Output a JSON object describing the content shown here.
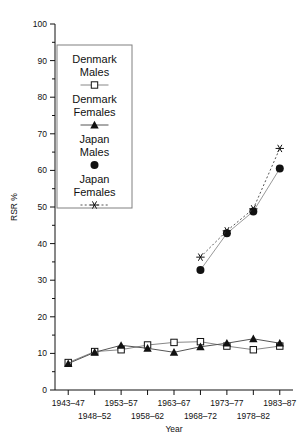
{
  "chart_data": {
    "type": "line",
    "title": "",
    "xlabel": "Year",
    "ylabel": "RSR %",
    "ylim": [
      0,
      100
    ],
    "ytick_step": 10,
    "yminor_step": 5,
    "grid": false,
    "legend_position": "upper-left-inset",
    "categories": [
      "1943-47",
      "1948-52",
      "1953-57",
      "1958-62",
      "1963-67",
      "1968-72",
      "1973-77",
      "1978-82",
      "1983-87"
    ],
    "xticklabels_row1": [
      "1943-47",
      "1953-57",
      "1963-67",
      "1973-77",
      "1983-87"
    ],
    "xticklabels_row2": [
      "1948-52",
      "1958-62",
      "1968-72",
      "1978-82"
    ],
    "yticklabels": [
      "0",
      "10",
      "20",
      "30",
      "40",
      "50",
      "60",
      "70",
      "80",
      "90",
      "100"
    ],
    "series": [
      {
        "name": "Denmark Males",
        "marker": "open-square",
        "linestyle": "solid",
        "color": "#888888",
        "values": [
          7.5,
          10.5,
          11.0,
          12.3,
          13.0,
          13.2,
          12.0,
          11.0,
          12.0
        ]
      },
      {
        "name": "Denmark Females",
        "marker": "filled-triangle",
        "linestyle": "solid",
        "color": "#555555",
        "values": [
          7.2,
          10.3,
          12.2,
          11.4,
          10.3,
          11.8,
          12.8,
          14.0,
          12.8
        ]
      },
      {
        "name": "Japan Males",
        "marker": "filled-circle",
        "linestyle": "solid",
        "color": "#999999",
        "values": [
          null,
          null,
          null,
          null,
          null,
          32.8,
          42.8,
          48.8,
          60.5
        ]
      },
      {
        "name": "Japan Females",
        "marker": "asterisk",
        "linestyle": "dashed",
        "color": "#555555",
        "values": [
          null,
          null,
          null,
          null,
          null,
          36.3,
          43.5,
          49.5,
          66.0
        ]
      }
    ]
  },
  "axes": {
    "y_title": "RSR %",
    "x_title": "Year"
  },
  "legend": {
    "items": [
      {
        "label_line1": "Denmark",
        "label_line2": "Males",
        "icon": "open-square-line-icon"
      },
      {
        "label_line1": "Denmark",
        "label_line2": "Females",
        "icon": "filled-triangle-line-icon"
      },
      {
        "label_line1": "Japan",
        "label_line2": "Males",
        "icon": "filled-circle-icon"
      },
      {
        "label_line1": "Japan",
        "label_line2": "Females",
        "icon": "asterisk-dashed-line-icon"
      }
    ]
  }
}
